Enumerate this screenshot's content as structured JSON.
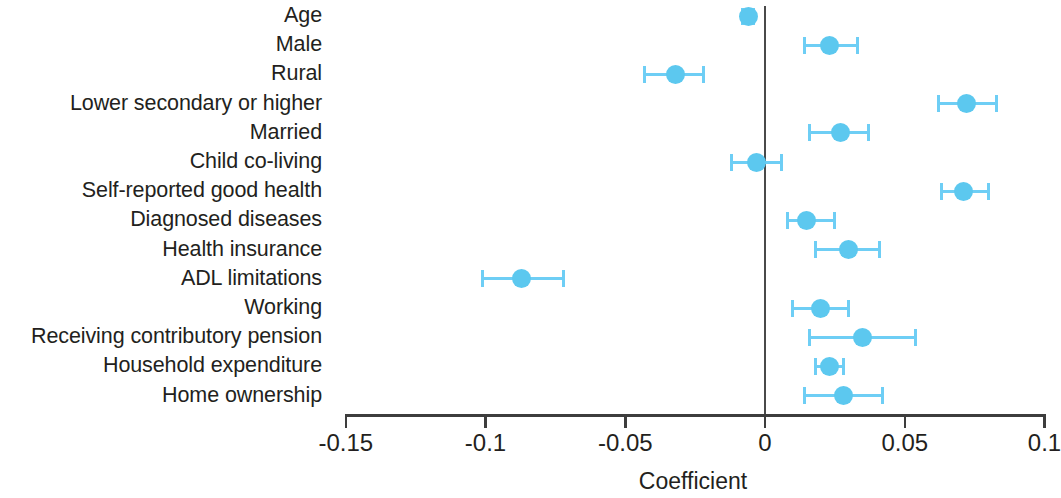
{
  "chart_data": {
    "type": "scatter",
    "subtype": "forest-plot-coefficients-with-95ci",
    "title": "",
    "xlabel": "Coefficient",
    "ylabel": "",
    "xlim": [
      -0.165,
      0.108
    ],
    "xticks": [
      -0.15,
      -0.1,
      -0.05,
      0,
      0.05,
      0.1
    ],
    "xtick_labels": [
      "-0.15",
      "-0.1",
      "-0.05",
      "0",
      "0.05",
      "0.1"
    ],
    "grid": false,
    "legend": null,
    "reference_line": 0,
    "marker_color": "#5cc8ef",
    "error_bar_color": "#6ecef5",
    "axis_color": "#3d3d3d",
    "categories": [
      "Age",
      "Male",
      "Rural",
      "Lower secondary or higher",
      "Married",
      "Child co-living",
      "Self-reported good health",
      "Diagnosed diseases",
      "Health insurance",
      "ADL limitations",
      "Working",
      "Receiving contributory pension",
      "Household expenditure",
      "Home ownership"
    ],
    "points": [
      {
        "label": "Age",
        "coefficient": -0.006,
        "ci_low": -0.008,
        "ci_high": -0.004
      },
      {
        "label": "Male",
        "coefficient": 0.023,
        "ci_low": 0.014,
        "ci_high": 0.033
      },
      {
        "label": "Rural",
        "coefficient": -0.032,
        "ci_low": -0.043,
        "ci_high": -0.022
      },
      {
        "label": "Lower secondary or higher",
        "coefficient": 0.072,
        "ci_low": 0.062,
        "ci_high": 0.083
      },
      {
        "label": "Married",
        "coefficient": 0.027,
        "ci_low": 0.016,
        "ci_high": 0.037
      },
      {
        "label": "Child co-living",
        "coefficient": -0.003,
        "ci_low": -0.012,
        "ci_high": 0.006
      },
      {
        "label": "Self-reported good health",
        "coefficient": 0.071,
        "ci_low": 0.063,
        "ci_high": 0.08
      },
      {
        "label": "Diagnosed diseases",
        "coefficient": 0.015,
        "ci_low": 0.008,
        "ci_high": 0.025
      },
      {
        "label": "Health insurance",
        "coefficient": 0.03,
        "ci_low": 0.018,
        "ci_high": 0.041
      },
      {
        "label": "ADL limitations",
        "coefficient": -0.087,
        "ci_low": -0.101,
        "ci_high": -0.072
      },
      {
        "label": "Working",
        "coefficient": 0.02,
        "ci_low": 0.01,
        "ci_high": 0.03
      },
      {
        "label": "Receiving contributory pension",
        "coefficient": 0.035,
        "ci_low": 0.016,
        "ci_high": 0.054
      },
      {
        "label": "Household expenditure",
        "coefficient": 0.023,
        "ci_low": 0.018,
        "ci_high": 0.028
      },
      {
        "label": "Home ownership",
        "coefficient": 0.028,
        "ci_low": 0.014,
        "ci_high": 0.042
      }
    ]
  }
}
